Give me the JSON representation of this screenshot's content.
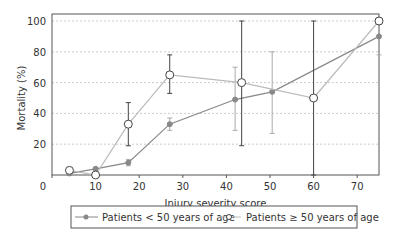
{
  "chart_data": {
    "type": "line",
    "title": "",
    "xlabel": "Injury severity score",
    "ylabel": "Mortality (%)",
    "xlim": [
      0,
      75
    ],
    "ylim": [
      0,
      100
    ],
    "xticks": [
      0,
      10,
      20,
      30,
      40,
      50,
      60,
      70
    ],
    "yticks": [
      20,
      40,
      60,
      80,
      100
    ],
    "grid": "horizontal dotted",
    "legend_position": "bottom",
    "series": [
      {
        "name": "Patients < 50 years of age",
        "marker": "filled-circle",
        "color": "#888888",
        "x": [
          4,
          10,
          17.5,
          27,
          42,
          50.5,
          75
        ],
        "y": [
          1,
          4,
          8,
          33,
          49,
          54,
          90
        ],
        "err_low": [
          0,
          3,
          6,
          29,
          29,
          27,
          78
        ],
        "err_high": [
          2,
          5,
          10,
          37,
          70,
          80,
          98
        ]
      },
      {
        "name": "Patients ≥ 50 years of age",
        "marker": "open-circle",
        "color": "#bbbbbb",
        "x": [
          4,
          10,
          17.5,
          27,
          43.5,
          60,
          75
        ],
        "y": [
          3,
          0,
          33,
          65,
          60,
          50,
          100
        ],
        "err_low": [
          3,
          0,
          19,
          53,
          19,
          0,
          100
        ],
        "err_high": [
          3,
          0,
          47,
          78,
          100,
          100,
          100
        ]
      }
    ]
  }
}
